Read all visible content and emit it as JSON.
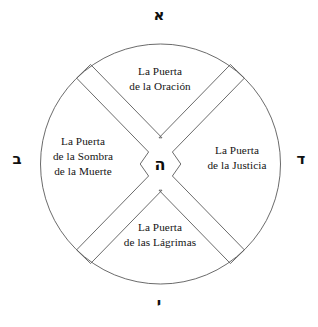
{
  "figure": {
    "shape": "circle-divided-in-four-quadrants",
    "stroke_color": "#5a5a5a",
    "text_color": "#141414",
    "background_color": "#ffffff"
  },
  "center": {
    "glyph": "ה",
    "glyph_name": "hebrew-letter-he"
  },
  "cardinal_glyphs": {
    "top": {
      "glyph": "א",
      "glyph_name": "hebrew-letter-aleph"
    },
    "right": {
      "glyph": "ד",
      "glyph_name": "hebrew-letter-dalet"
    },
    "bottom": {
      "glyph": "י",
      "glyph_name": "hebrew-letter-yod"
    },
    "left": {
      "glyph": "ב",
      "glyph_name": "hebrew-letter-bet"
    }
  },
  "quadrants": {
    "north": {
      "name": "puerta-de-la-oracion",
      "line1": "La Puerta",
      "line2": "de la Oración",
      "line3": ""
    },
    "east": {
      "name": "puerta-de-la-justicia",
      "line1": "La Puerta",
      "line2": "de la Justicia",
      "line3": ""
    },
    "south": {
      "name": "puerta-de-las-lagrimas",
      "line1": "La Puerta",
      "line2": "de las Lágrimas",
      "line3": ""
    },
    "west": {
      "name": "puerta-de-la-sombra-de-la-muerte",
      "line1": "La Puerta",
      "line2": "de la Sombra",
      "line3": "de la Muerte"
    }
  }
}
